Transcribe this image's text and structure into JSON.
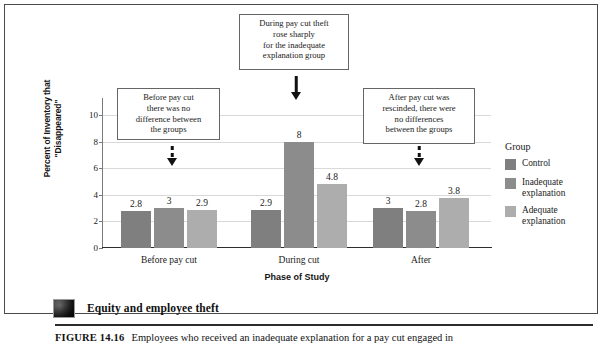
{
  "chart_data": {
    "type": "bar",
    "title": "",
    "xlabel": "Phase of Study",
    "ylabel": "Percent of Inventory that \"Disappeared\"",
    "ylim": [
      0,
      11
    ],
    "yticks": [
      0,
      2,
      4,
      6,
      8,
      10
    ],
    "ytick_labels": [
      "0",
      "2",
      "4",
      "6",
      "8",
      "10"
    ],
    "grid": true,
    "legend_position": "right",
    "legend_title": "Group",
    "categories": [
      "Before pay cut",
      "During cut",
      "After"
    ],
    "series": [
      {
        "name": "Control",
        "color": "#7f7f7f",
        "values": [
          2.8,
          2.9,
          3
        ],
        "labels": [
          "2.8",
          "2.9",
          "3"
        ]
      },
      {
        "name": "Inadequate explanation",
        "color": "#8c8c8c",
        "values": [
          3,
          8,
          2.8
        ],
        "labels": [
          "3",
          "8",
          "2.8"
        ]
      },
      {
        "name": "Adequate explanation",
        "color": "#adadad",
        "values": [
          2.9,
          4.8,
          3.8
        ],
        "labels": [
          "2.9",
          "4.8",
          "3.8"
        ]
      }
    ],
    "annotations": [
      {
        "id": "before",
        "text": "Before pay cut there was no difference between the groups",
        "lines": [
          "Before pay cut",
          "there was no",
          "difference between",
          "the groups"
        ],
        "arrow": "dashed",
        "points_to": "Before pay cut / Inadequate explanation"
      },
      {
        "id": "during",
        "text": "During pay cut theft rose sharply for the inadequate explanation group",
        "lines": [
          "During pay cut theft",
          "rose sharply",
          "for the inadequate",
          "explanation group"
        ],
        "arrow": "solid",
        "points_to": "During cut / Inadequate explanation"
      },
      {
        "id": "after",
        "text": "After pay cut was rescinded, there were no differences between the groups",
        "lines": [
          "After pay cut was",
          "rescinded, there were",
          "no differences",
          "between the groups"
        ],
        "arrow": "dashed",
        "points_to": "After / Inadequate explanation"
      }
    ]
  },
  "footer": {
    "photo_caption": "Equity and employee theft",
    "figure_label": "FIGURE 14.16",
    "figure_text": "Employees who received an inadequate explanation for a pay cut engaged in"
  },
  "colors": {
    "control": "#7f7f7f",
    "inadequate": "#8c8c8c",
    "adequate": "#adadad",
    "gridline": "#d9d9d9",
    "axis": "#2d2d2d",
    "frame": "#4a4a4a"
  }
}
